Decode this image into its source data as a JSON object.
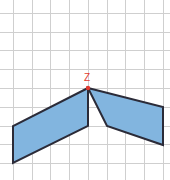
{
  "figure": {
    "canvas": {
      "width": 170,
      "height": 180,
      "background": "#ffffff"
    },
    "grid": {
      "color": "#cfcfcf",
      "spacing": 18.7,
      "origin_x": 13,
      "origin_y": 13,
      "vertical_x": [
        13,
        32,
        50,
        69,
        88,
        107,
        125,
        144,
        163
      ],
      "horizontal_y": [
        13,
        32,
        50,
        69,
        88,
        107,
        126,
        144,
        163
      ]
    },
    "shapes": [
      {
        "name": "left-parallelogram",
        "fill": "#82b5df",
        "stroke": "#2b2b38",
        "stroke_width": 2,
        "points": "88,88 88,126 13,163 13,126"
      },
      {
        "name": "right-parallelogram",
        "fill": "#82b5df",
        "stroke": "#2b2b38",
        "stroke_width": 2,
        "points": "88,88 163,107 163,145 107,126"
      }
    ],
    "vertex": {
      "label": "Z",
      "label_color": "#e23b30",
      "label_x": 87,
      "label_y": 81,
      "dot_color": "#e23b30",
      "dot_x": 88,
      "dot_y": 88,
      "dot_r": 2.2
    }
  }
}
